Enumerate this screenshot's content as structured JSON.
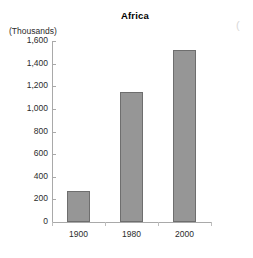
{
  "chart_data": {
    "type": "bar",
    "title": "Africa",
    "units_label": "(Thousands)",
    "xlabel": "",
    "ylabel": "",
    "categories": [
      "1900",
      "1980",
      "2000"
    ],
    "values": [
      270,
      1150,
      1520
    ],
    "series": [
      {
        "name": "Africa",
        "values": [
          270,
          1150,
          1520
        ]
      }
    ],
    "ylim": [
      0,
      1600
    ],
    "ytick_values": [
      0,
      200,
      400,
      600,
      800,
      1000,
      1200,
      1400,
      1600
    ],
    "ytick_labels": [
      "0",
      "200",
      "400",
      "600",
      "800",
      "1,000",
      "1,200",
      "1,400",
      "1,600"
    ],
    "grid": false,
    "legend": false,
    "legend_position": "none",
    "bar_color": "#969696",
    "bar_border_color": "#6e6e6e",
    "axis_color": "#a9a9a9"
  },
  "artifacts": {
    "edge_glyph": "("
  }
}
